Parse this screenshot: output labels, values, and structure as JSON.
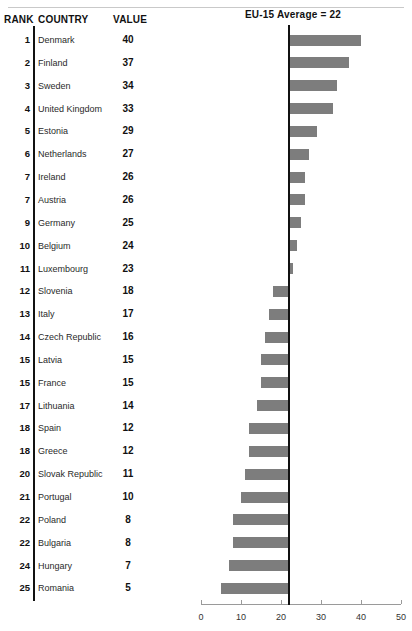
{
  "header": {
    "rank_label": "RANK",
    "country_label": "COUNTRY",
    "value_label": "VALUE",
    "average_label": "EU-15 Average = 22"
  },
  "chart_data": {
    "type": "bar",
    "title": "EU-15 Average = 22",
    "orientation": "horizontal",
    "reference_line": 22,
    "reference_line_label": "EU-15 Average = 22",
    "xlabel": "",
    "ylabel": "",
    "xlim": [
      0,
      50
    ],
    "xticks": [
      0,
      10,
      20,
      30,
      40,
      50
    ],
    "xtick_labels": [
      "0",
      "10",
      "20",
      "30",
      "40",
      "50"
    ],
    "grid": false,
    "legend": "none",
    "bar_color": "#7d7d7d",
    "categories": [
      "Denmark",
      "Finland",
      "Sweden",
      "United Kingdom",
      "Estonia",
      "Netherlands",
      "Ireland",
      "Austria",
      "Germany",
      "Belgium",
      "Luxembourg",
      "Slovenia",
      "Italy",
      "Czech Republic",
      "Latvia",
      "France",
      "Lithuania",
      "Spain",
      "Greece",
      "Slovak Republic",
      "Portugal",
      "Poland",
      "Bulgaria",
      "Hungary",
      "Romania"
    ],
    "values": [
      40,
      37,
      34,
      33,
      29,
      27,
      26,
      26,
      25,
      24,
      23,
      18,
      17,
      16,
      15,
      15,
      14,
      12,
      12,
      11,
      10,
      8,
      8,
      7,
      5
    ],
    "ranks": [
      1,
      2,
      3,
      4,
      5,
      6,
      7,
      7,
      9,
      10,
      11,
      12,
      13,
      14,
      15,
      15,
      17,
      18,
      18,
      20,
      21,
      22,
      22,
      24,
      25
    ]
  },
  "rows": [
    {
      "rank": "1",
      "country": "Denmark",
      "value": "40"
    },
    {
      "rank": "2",
      "country": "Finland",
      "value": "37"
    },
    {
      "rank": "3",
      "country": "Sweden",
      "value": "34"
    },
    {
      "rank": "4",
      "country": "United Kingdom",
      "value": "33"
    },
    {
      "rank": "5",
      "country": "Estonia",
      "value": "29"
    },
    {
      "rank": "6",
      "country": "Netherlands",
      "value": "27"
    },
    {
      "rank": "7",
      "country": "Ireland",
      "value": "26"
    },
    {
      "rank": "7",
      "country": "Austria",
      "value": "26"
    },
    {
      "rank": "9",
      "country": "Germany",
      "value": "25"
    },
    {
      "rank": "10",
      "country": "Belgium",
      "value": "24"
    },
    {
      "rank": "11",
      "country": "Luxembourg",
      "value": "23"
    },
    {
      "rank": "12",
      "country": "Slovenia",
      "value": "18"
    },
    {
      "rank": "13",
      "country": "Italy",
      "value": "17"
    },
    {
      "rank": "14",
      "country": "Czech Republic",
      "value": "16"
    },
    {
      "rank": "15",
      "country": "Latvia",
      "value": "15"
    },
    {
      "rank": "15",
      "country": "France",
      "value": "15"
    },
    {
      "rank": "17",
      "country": "Lithuania",
      "value": "14"
    },
    {
      "rank": "18",
      "country": "Spain",
      "value": "12"
    },
    {
      "rank": "18",
      "country": "Greece",
      "value": "12"
    },
    {
      "rank": "20",
      "country": "Slovak Republic",
      "value": "11"
    },
    {
      "rank": "21",
      "country": "Portugal",
      "value": "10"
    },
    {
      "rank": "22",
      "country": "Poland",
      "value": "8"
    },
    {
      "rank": "22",
      "country": "Bulgaria",
      "value": "8"
    },
    {
      "rank": "24",
      "country": "Hungary",
      "value": "7"
    },
    {
      "rank": "25",
      "country": "Romania",
      "value": "5"
    }
  ],
  "axis": {
    "labels": [
      "0",
      "10",
      "20",
      "30",
      "40",
      "50"
    ]
  }
}
